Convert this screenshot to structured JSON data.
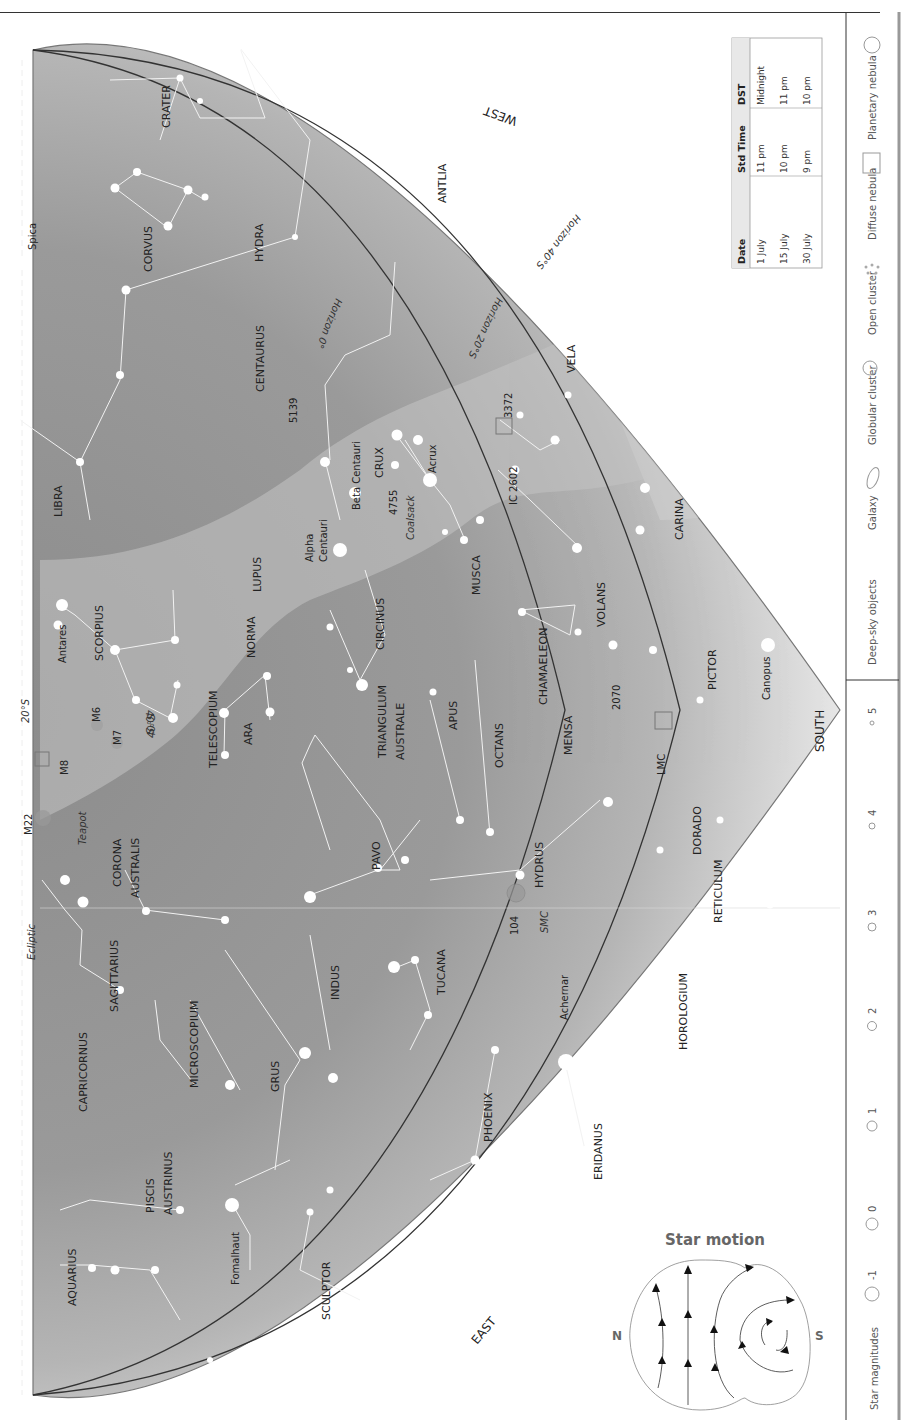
{
  "header": {
    "caption_fragment": "y p g j y y ,"
  },
  "map": {
    "directions": {
      "west": "WEST",
      "east": "EAST",
      "south": "SOUTH"
    },
    "horizons": [
      "Horizon 0°",
      "Horizon 20°S",
      "Horizon 40°S"
    ],
    "ecliptic_label": "Ecliptic",
    "lat_marks": [
      "20°S",
      "40°S",
      "40°S"
    ],
    "constellations": [
      "CRATER",
      "CORVUS",
      "HYDRA",
      "ANTLIA",
      "VELA",
      "CENTAURUS",
      "LIBRA",
      "CRUX",
      "CARINA",
      "LUPUS",
      "MUSCA",
      "SCORPIUS",
      "NORMA",
      "CIRCINUS",
      "CHAMAELEON",
      "VOLANS",
      "TELESCOPIUM",
      "ARA",
      "TRIANGULUM",
      "AUSTRALE",
      "APUS",
      "OCTANS",
      "MENSA",
      "PICTOR",
      "CORONA",
      "AUSTRALIS",
      "PAVO",
      "HYDRUS",
      "DORADO",
      "SAGITTARIUS",
      "INDUS",
      "TUCANA",
      "RETICULUM",
      "CAPRICORNUS",
      "MICROSCOPIUM",
      "GRUS",
      "HOROLOGIUM",
      "PHOENIX",
      "ERIDANUS",
      "PISCIS",
      "AUSTRINUS",
      "AQUARIUS",
      "SCULPTOR"
    ],
    "stars": [
      "Spica",
      "Antares",
      "Beta Centauri",
      "Alpha",
      "Centauri",
      "Acrux",
      "Canopus",
      "Achernar",
      "Fomalhaut"
    ],
    "deep_sky": [
      "5139",
      "3372",
      "IC 2602",
      "4755",
      "Coalsack",
      "M6",
      "M7",
      "M8",
      "M22",
      "Teapot",
      "2070",
      "LMC",
      "104",
      "SMC"
    ]
  },
  "time_table": {
    "headers": [
      "Date",
      "Std Time",
      "DST"
    ],
    "rows": [
      [
        "1 July",
        "11 pm",
        "Midnight"
      ],
      [
        "15 July",
        "10 pm",
        "11 pm"
      ],
      [
        "30 July",
        "9 pm",
        "10 pm"
      ]
    ]
  },
  "legend": {
    "star_magnitudes_label": "Star magnitudes",
    "magnitudes": [
      "-1",
      "0",
      "1",
      "2",
      "3",
      "4",
      "5"
    ],
    "deep_sky_label": "Deep-sky objects",
    "objects": [
      {
        "label": "Galaxy",
        "icon": "galaxy-ellipse-icon"
      },
      {
        "label": "Globular cluster",
        "icon": "globular-cluster-icon"
      },
      {
        "label": "Open cluster",
        "icon": "open-cluster-icon"
      },
      {
        "label": "Diffuse nebula",
        "icon": "diffuse-nebula-square-icon"
      },
      {
        "label": "Planetary nebula",
        "icon": "planetary-nebula-circle-icon"
      }
    ]
  },
  "star_motion": {
    "title": "Star motion",
    "north": "N",
    "south": "S"
  },
  "colors": {
    "sky_dark": "#8f8f8f",
    "sky_mid": "#a8a8a8",
    "sky_light": "#dcdcdc",
    "milky_way": "#b9b9b9",
    "horizon_line": "#333333",
    "star": "#ffffff"
  }
}
